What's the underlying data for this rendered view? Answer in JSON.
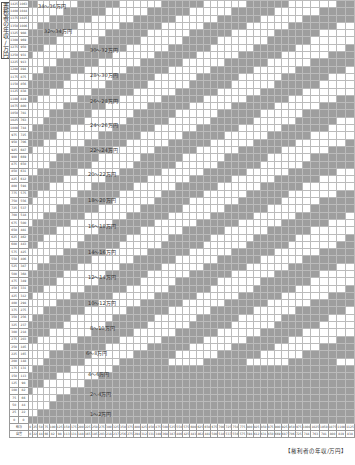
{
  "chart_data": {
    "type": "heatmap",
    "ylabel": "義務者の年収/万円",
    "xlabel": "権利者の年収/万円",
    "row_headers": [
      "給与",
      "自営"
    ],
    "x_salary": [
      0,
      25,
      50,
      75,
      100,
      125,
      150,
      175,
      200,
      225,
      250,
      275,
      300,
      325,
      350,
      375,
      400,
      425,
      450,
      475,
      500,
      525,
      550,
      575,
      600,
      625,
      650,
      675,
      700,
      725,
      750,
      775,
      800,
      825,
      850,
      875,
      900,
      925,
      950,
      975,
      1000,
      1025,
      1050,
      1075,
      1100,
      1125
    ],
    "x_self": [
      0,
      22,
      44,
      66,
      82,
      98,
      113,
      131,
      148,
      165,
      185,
      203,
      218,
      237,
      256,
      275,
      294,
      312,
      331,
      349,
      368,
      387,
      406,
      425,
      443,
      462,
      481,
      500,
      518,
      537,
      556,
      575,
      594,
      612,
      631,
      650,
      669,
      687,
      706,
      725,
      744,
      763,
      781,
      800,
      819,
      838
    ],
    "y_salary": [
      0,
      25,
      50,
      75,
      100,
      125,
      150,
      175,
      200,
      225,
      250,
      275,
      300,
      325,
      350,
      375,
      400,
      425,
      450,
      475,
      500,
      525,
      550,
      575,
      600,
      625,
      650,
      675,
      700,
      725,
      750,
      775,
      800,
      825,
      850,
      875,
      900,
      925,
      950,
      975,
      1000,
      1025,
      1050,
      1075,
      1100,
      1125,
      1150,
      1175,
      1200,
      1225,
      1250,
      1275,
      1300,
      1325,
      1350,
      1375,
      1400,
      1425
    ],
    "y_self": [
      0,
      22,
      44,
      66,
      82,
      98,
      113,
      131,
      148,
      165,
      185,
      203,
      218,
      237,
      256,
      275,
      294,
      312,
      331,
      349,
      368,
      387,
      406,
      425,
      443,
      462,
      481,
      500,
      518,
      537,
      556,
      575,
      594,
      612,
      631,
      650,
      669,
      687,
      706,
      725,
      744,
      763,
      781,
      800,
      819,
      838,
      856,
      875,
      894,
      913,
      931,
      950,
      969,
      988,
      1006,
      1025,
      1044,
      1063
    ],
    "bands": [
      "0〜1万円",
      "1〜2万円",
      "2〜4万円",
      "4〜6万円",
      "6〜8万円",
      "8〜10万円",
      "10〜12万円",
      "12〜14万円",
      "14〜16万円",
      "16〜18万円",
      "18〜20万円",
      "20〜22万円",
      "22〜24万円",
      "24〜26万円",
      "26〜28万円",
      "28〜30万円",
      "30〜32万円",
      "32〜34万円",
      "34〜36万円"
    ],
    "band_labels": [
      {
        "text": "1〜2万円",
        "top": 410,
        "left": 90
      },
      {
        "text": "2〜4万円",
        "top": 390,
        "left": 90
      },
      {
        "text": "4〜6万円",
        "top": 370,
        "left": 88
      },
      {
        "text": "6〜8万円",
        "top": 349,
        "left": 86
      },
      {
        "text": "8〜10万円",
        "top": 324,
        "left": 90
      },
      {
        "text": "10〜12万円",
        "top": 299,
        "left": 88
      },
      {
        "text": "12〜14万円",
        "top": 273,
        "left": 88
      },
      {
        "text": "14〜16万円",
        "top": 248,
        "left": 88
      },
      {
        "text": "16〜18万円",
        "top": 222,
        "left": 88
      },
      {
        "text": "18〜20万円",
        "top": 196,
        "left": 88
      },
      {
        "text": "20〜22万円",
        "top": 170,
        "left": 88
      },
      {
        "text": "22〜24万円",
        "top": 146,
        "left": 90
      },
      {
        "text": "24〜26万円",
        "top": 121,
        "left": 90
      },
      {
        "text": "26〜28万円",
        "top": 97,
        "left": 90
      },
      {
        "text": "28〜30万円",
        "top": 71,
        "left": 90
      },
      {
        "text": "30〜32万円",
        "top": 46,
        "left": 90
      },
      {
        "text": "32〜34万円",
        "top": 27,
        "left": 44
      },
      {
        "text": "34〜36万円",
        "top": 2,
        "left": 38
      }
    ],
    "colors": {
      "band_dark": "#9e9e9e",
      "band_light": "#ffffff",
      "grid": "#bbbbbb"
    }
  }
}
